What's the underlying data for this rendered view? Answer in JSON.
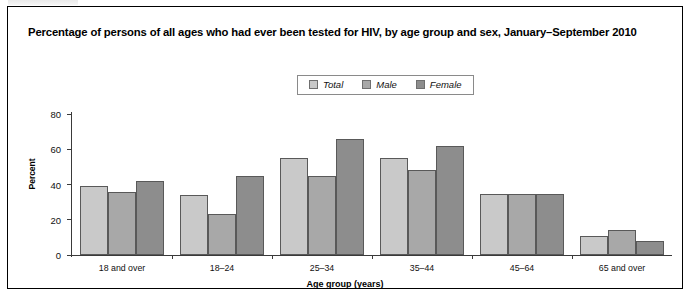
{
  "figure": {
    "title": "Percentage of persons of all ages who had ever been tested for HIV, by age group and sex, January–September 2010"
  },
  "legend": {
    "items": [
      {
        "label": "Total",
        "color": "#c9c9c9"
      },
      {
        "label": "Male",
        "color": "#a8a8a8"
      },
      {
        "label": "Female",
        "color": "#8d8d8d"
      }
    ]
  },
  "axes": {
    "y_label": "Percent",
    "x_label": "Age group (years)",
    "y_ticks": [
      "0",
      "20",
      "40",
      "60",
      "80"
    ]
  },
  "chart_data": {
    "type": "bar",
    "title": "Percentage of persons of all ages who had ever been tested for HIV, by age group and sex, January–September 2010",
    "xlabel": "Age group (years)",
    "ylabel": "Percent",
    "ylim": [
      0,
      80
    ],
    "yticks": [
      0,
      20,
      40,
      60,
      80
    ],
    "grid": false,
    "legend_position": "top-center",
    "categories": [
      "18 and over",
      "18–24",
      "25–34",
      "35–44",
      "45–64",
      "65 and over"
    ],
    "series": [
      {
        "name": "Total",
        "color": "#c9c9c9",
        "values": [
          39,
          34,
          55,
          55,
          34.5,
          11
        ]
      },
      {
        "name": "Male",
        "color": "#a8a8a8",
        "values": [
          36,
          23,
          45,
          48,
          34.5,
          14
        ]
      },
      {
        "name": "Female",
        "color": "#8d8d8d",
        "values": [
          42,
          45,
          66,
          62,
          34.5,
          8
        ]
      }
    ]
  }
}
